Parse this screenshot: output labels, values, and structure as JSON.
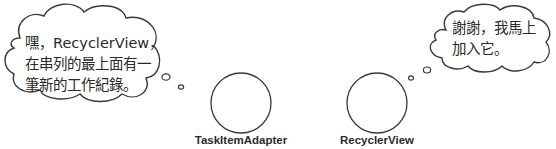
{
  "diagram": {
    "left_bubble": {
      "speaker": "TaskItemAdapter",
      "lines": [
        "嘿，RecyclerView，",
        "在串列的最上面有一",
        "筆新的工作紀錄。"
      ]
    },
    "right_bubble": {
      "speaker": "RecyclerView",
      "lines": [
        "謝謝，我馬上",
        "加入它。"
      ]
    },
    "actors": [
      {
        "name": "TaskItemAdapter"
      },
      {
        "name": "RecyclerView"
      }
    ],
    "colors": {
      "stroke": "#3a3a3a",
      "text": "#2a2a2a",
      "background": "#ffffff"
    }
  }
}
